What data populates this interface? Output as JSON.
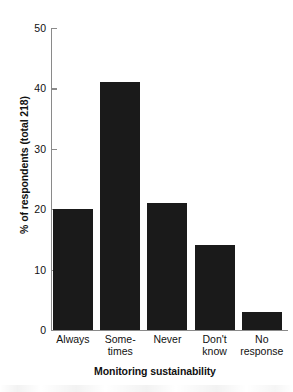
{
  "chart_data": {
    "type": "bar",
    "title": "",
    "categories": [
      "Always",
      "Some-times",
      "Never",
      "Don't know",
      "No response"
    ],
    "category_lines": [
      [
        "Always"
      ],
      [
        "Some-",
        "times"
      ],
      [
        "Never"
      ],
      [
        "Don't",
        "know"
      ],
      [
        "No",
        "response"
      ]
    ],
    "values": [
      20,
      41,
      21,
      14,
      3
    ],
    "xlabel": "Monitoring sustainability",
    "ylabel": "% of respondents (total 218)",
    "ylim": [
      0,
      50
    ],
    "yticks": [
      0,
      10,
      20,
      30,
      40,
      50
    ],
    "ytick_labels": [
      "0",
      "10",
      "20",
      "30",
      "40",
      "50"
    ],
    "grid": false,
    "legend": null,
    "bar_color": "#1a1a1a",
    "axis_color": "#8a8a8a",
    "text_color": "#111111"
  }
}
